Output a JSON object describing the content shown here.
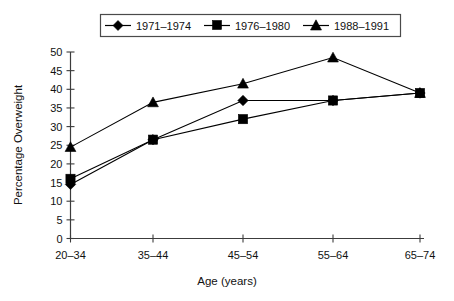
{
  "chart_data": {
    "type": "line",
    "title": "",
    "xlabel": "Age (years)",
    "ylabel": "Percentage Overweight",
    "categories": [
      "20–34",
      "35–44",
      "45–54",
      "55–64",
      "65–74"
    ],
    "ylim": [
      0,
      50
    ],
    "yticks": [
      0,
      5,
      10,
      15,
      20,
      25,
      30,
      35,
      40,
      45,
      50
    ],
    "grid": false,
    "legend_position": "top",
    "series": [
      {
        "name": "1971–1974",
        "marker": "diamond",
        "values": [
          14.5,
          26.5,
          37.0,
          37.0,
          39.0
        ]
      },
      {
        "name": "1976–1980",
        "marker": "square",
        "values": [
          16.0,
          26.5,
          32.0,
          37.0,
          39.0
        ]
      },
      {
        "name": "1988–1991",
        "marker": "triangle",
        "values": [
          24.5,
          36.5,
          41.5,
          48.5,
          39.0
        ]
      }
    ]
  },
  "axes": {
    "y_title": "Percentage Overweight",
    "x_title": "Age (years)",
    "y_tick_labels": [
      "0",
      "5",
      "10",
      "15",
      "20",
      "25",
      "30",
      "35",
      "40",
      "45",
      "50"
    ],
    "x_tick_labels": [
      "20–34",
      "35–44",
      "45–54",
      "55–64",
      "65–74"
    ]
  },
  "legend": {
    "entries": [
      {
        "label": "1971–1974",
        "marker": "diamond-marker-icon"
      },
      {
        "label": "1976–1980",
        "marker": "square-marker-icon"
      },
      {
        "label": "1988–1991",
        "marker": "triangle-marker-icon"
      }
    ]
  },
  "colors": {
    "ink": "#000000",
    "axis": "#3c3c3c",
    "background": "#ffffff"
  }
}
